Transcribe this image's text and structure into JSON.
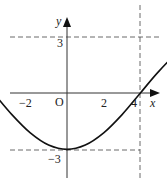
{
  "chart_data": {
    "type": "line",
    "title": "",
    "xlabel": "x",
    "ylabel": "y",
    "origin_label": "O",
    "x_ticks": [
      {
        "value": -2,
        "label": "−2"
      },
      {
        "value": 2,
        "label": "2"
      },
      {
        "value": 4,
        "label": "4"
      }
    ],
    "y_ticks": [
      {
        "value": 3,
        "label": "3"
      },
      {
        "value": -3,
        "label": "−3"
      }
    ],
    "x": [
      -2,
      -1.5,
      -1,
      -0.5,
      0,
      0.5,
      1,
      1.5,
      2,
      2.5,
      3,
      3.5,
      4
    ],
    "series": [
      {
        "name": "f(x)",
        "values": [
          0,
          -1.15,
          -2.12,
          -2.77,
          -3,
          -2.77,
          -2.12,
          -1.15,
          0,
          1.15,
          2.12,
          2.77,
          3
        ]
      }
    ],
    "key_points": [
      {
        "x": -2,
        "y": 0
      },
      {
        "x": 0,
        "y": -3,
        "note": "minimum"
      },
      {
        "x": 2,
        "y": 0
      },
      {
        "x": 4,
        "y": 3,
        "note": "maximum"
      }
    ],
    "guide_lines": [
      {
        "type": "horizontal",
        "y": 3,
        "style": "dashed"
      },
      {
        "type": "horizontal",
        "y": -3,
        "style": "dashed"
      },
      {
        "type": "vertical",
        "x": 4,
        "style": "dashed"
      }
    ],
    "xlim": [
      -2.5,
      4.5
    ],
    "ylim": [
      -4,
      4
    ],
    "grid": false,
    "legend": "none"
  }
}
